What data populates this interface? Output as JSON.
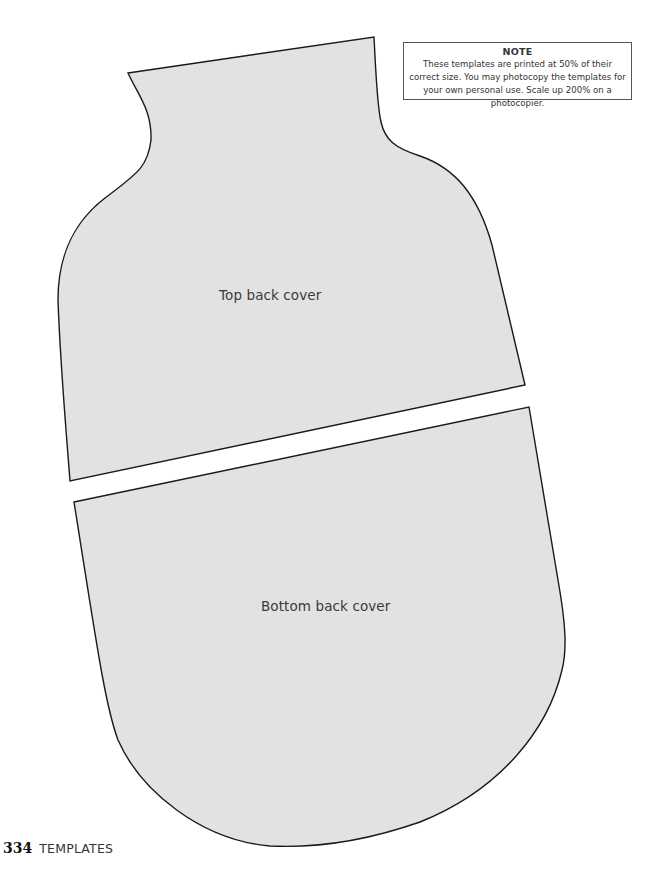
{
  "note": {
    "title": "NOTE",
    "body": "These templates are printed at 50% of their correct size. You may photocopy the templates for your own personal use. Scale up 200% on a photocopier."
  },
  "templates": [
    {
      "label": "Top back cover",
      "fill": "#e2e2e2",
      "stroke": "#1a1a1a"
    },
    {
      "label": "Bottom back cover",
      "fill": "#e2e2e2",
      "stroke": "#1a1a1a"
    }
  ],
  "footer": {
    "page_number": "334",
    "section": "TEMPLATES"
  }
}
